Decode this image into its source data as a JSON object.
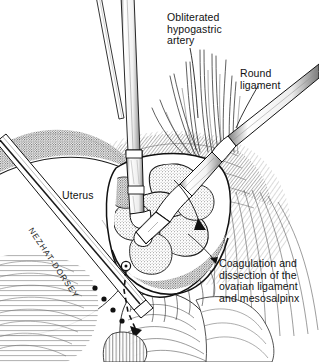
{
  "figure": {
    "style": "grayscale pen-and-ink medical illustration",
    "background_color": "#ffffff",
    "ink_color": "#111111"
  },
  "labels": {
    "obliterated_hypogastric_artery": "Obliterated\nhypogastric\nartery",
    "round_ligament": "Round\nligament",
    "uterus": "Uterus",
    "caption": "Coagulation and\ndissection of the\novarian ligament\nand mesosalpinx"
  },
  "instruments": {
    "lower_left_shaft_text": "NEZHAT-DORSEY",
    "vertical_probe_name": "suction-irrigator-probe",
    "right_shaft_name": "bipolar-forceps",
    "thin_shaft_name": "grasper-shaft"
  },
  "anatomy": {
    "uterus_name": "uterus-dome",
    "vessels_name": "vessel-strands",
    "ovarian_ligament_name": "ovarian-ligament-tissue",
    "bowel_name": "bowel-tissue",
    "pelvic_wall_name": "pelvic-sidewall"
  }
}
